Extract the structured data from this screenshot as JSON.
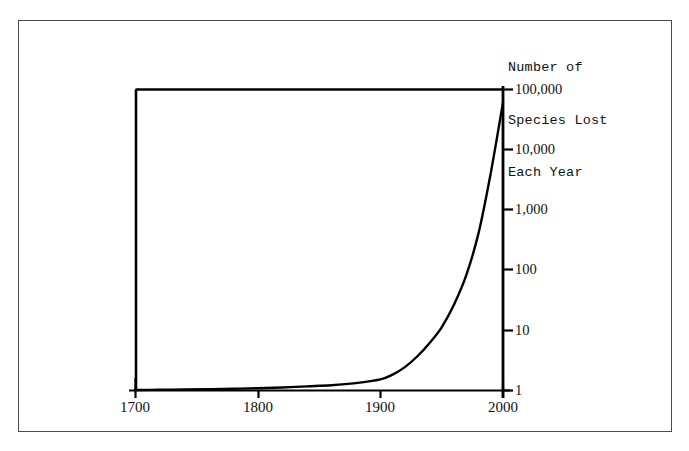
{
  "figure": {
    "border_color": "#4a4a4a",
    "background": "#ffffff"
  },
  "chart_data": {
    "type": "line",
    "title": "Number of Species Lost Each Year",
    "title_lines": [
      "Number of",
      "Species Lost",
      "Each Year"
    ],
    "xlabel": "",
    "ylabel": "",
    "yscale": "log",
    "ylim": [
      1,
      100000
    ],
    "xlim": [
      1700,
      2000
    ],
    "grid": false,
    "legend": null,
    "axis_color": "#000000",
    "line_color": "#000000",
    "xticks": [
      1700,
      1800,
      1900,
      2000
    ],
    "xtick_labels": [
      "1700",
      "1800",
      "1900",
      "2000"
    ],
    "yticks": [
      1,
      10,
      100,
      1000,
      10000,
      100000
    ],
    "ytick_labels": [
      "1",
      "10",
      "100",
      "1,000",
      "10,000",
      "100,000"
    ],
    "ytick_label_side": "right",
    "x": [
      1700,
      1720,
      1740,
      1760,
      1780,
      1800,
      1820,
      1840,
      1860,
      1880,
      1900,
      1910,
      1920,
      1930,
      1940,
      1950,
      1960,
      1970,
      1980,
      1990,
      2000
    ],
    "values": [
      1.0,
      1.01,
      1.02,
      1.03,
      1.05,
      1.07,
      1.1,
      1.15,
      1.2,
      1.3,
      1.5,
      1.8,
      2.4,
      3.6,
      6.0,
      11.0,
      26.0,
      80.0,
      400.0,
      4000.0,
      60000.0
    ],
    "series": [
      {
        "name": "Species lost per year",
        "values": [
          1.0,
          1.01,
          1.02,
          1.03,
          1.05,
          1.07,
          1.1,
          1.15,
          1.2,
          1.3,
          1.5,
          1.8,
          2.4,
          3.6,
          6.0,
          11.0,
          26.0,
          80.0,
          400.0,
          4000.0,
          60000.0
        ]
      }
    ],
    "annotations": []
  },
  "geometry": {
    "plot_left": 135,
    "plot_right": 503,
    "plot_top": 89,
    "plot_bottom": 390,
    "decade_px": 60.2
  }
}
